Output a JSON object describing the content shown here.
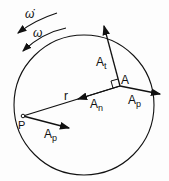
{
  "labels": {
    "omega_dot": "ω̇",
    "omega": "ω",
    "r": "r",
    "point_P": "P",
    "point_A": "A",
    "A_t_main": "A",
    "A_t_sub": "t",
    "A_n_main": "A",
    "A_n_sub": "n",
    "A_p_main": "A",
    "A_p_sub": "p",
    "A_p2_main": "A",
    "A_p2_sub": "p"
  }
}
